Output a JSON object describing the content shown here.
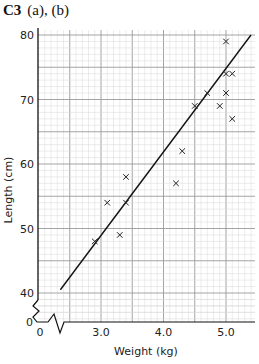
{
  "heading": {
    "code": "C3",
    "parts": "(a), (b)"
  },
  "chart_data": {
    "type": "scatter",
    "xlabel": "Weight (kg)",
    "ylabel": "Length (cm)",
    "x_ticks": [
      "0",
      "3.0",
      "4.0",
      "5.0"
    ],
    "y_ticks": [
      "0",
      "40",
      "50",
      "60",
      "70",
      "80"
    ],
    "xlim": [
      2.0,
      5.5
    ],
    "ylim": [
      35,
      82
    ],
    "axis_break": true,
    "grid": true,
    "points": [
      {
        "x": 2.9,
        "y": 48
      },
      {
        "x": 3.1,
        "y": 54
      },
      {
        "x": 3.3,
        "y": 49
      },
      {
        "x": 3.4,
        "y": 54
      },
      {
        "x": 3.4,
        "y": 58
      },
      {
        "x": 4.2,
        "y": 57
      },
      {
        "x": 4.3,
        "y": 62
      },
      {
        "x": 4.5,
        "y": 69
      },
      {
        "x": 4.7,
        "y": 71
      },
      {
        "x": 4.9,
        "y": 69
      },
      {
        "x": 5.0,
        "y": 71
      },
      {
        "x": 5.0,
        "y": 74
      },
      {
        "x": 5.0,
        "y": 79
      },
      {
        "x": 5.1,
        "y": 74
      },
      {
        "x": 5.1,
        "y": 67
      }
    ],
    "line_of_best_fit": {
      "from": {
        "x": 2.35,
        "y": 40.5
      },
      "to": {
        "x": 5.4,
        "y": 80
      }
    },
    "marker": "x"
  }
}
